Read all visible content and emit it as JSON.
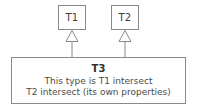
{
  "diagram": {
    "kind": "uml-class-diagram",
    "background_color": "#ffffff",
    "line_color": "#8a8a8a",
    "text_color": "#3a3a3a",
    "supertypes": [
      {
        "name": "T1"
      },
      {
        "name": "T2"
      }
    ],
    "subtype": {
      "title": "T3",
      "description_lines": [
        "This type is T1 intersect",
        "T2 intersect (its own properties)"
      ]
    },
    "relationships": [
      {
        "type": "generalization",
        "from": "T3",
        "to": "T1",
        "arrowhead": "hollow-triangle"
      },
      {
        "type": "generalization",
        "from": "T3",
        "to": "T2",
        "arrowhead": "hollow-triangle"
      }
    ]
  }
}
